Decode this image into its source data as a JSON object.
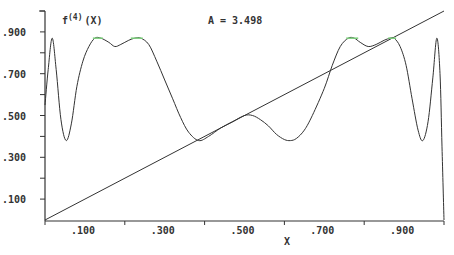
{
  "chart_data": {
    "type": "line",
    "title": "f(4)(X)",
    "title_base": "f",
    "title_sup": "(4)",
    "title_arg": "(X)",
    "annotation": "A = 3.498",
    "xlabel": "X",
    "ylabel": "",
    "xlim": [
      0,
      1
    ],
    "ylim": [
      0,
      1
    ],
    "grid": false,
    "x_tick_labels": [
      ".100",
      ".300",
      ".500",
      ".700",
      ".900"
    ],
    "x_tick_values": [
      0.1,
      0.3,
      0.5,
      0.7,
      0.9
    ],
    "x_minor_ticks": [
      0.0,
      0.2,
      0.4,
      0.6,
      0.8,
      1.0
    ],
    "y_tick_labels": [
      ".100",
      ".300",
      ".500",
      ".700",
      ".900"
    ],
    "y_tick_values": [
      0.1,
      0.3,
      0.5,
      0.7,
      0.9
    ],
    "y_minor_ticks": [
      0.2,
      0.4,
      0.6,
      0.8,
      1.0
    ],
    "colors": {
      "curve": "#333333",
      "axis": "#333333",
      "highlight": "#7ccf7c"
    },
    "series": [
      {
        "name": "f(4)(X)",
        "x": [
          0.0,
          0.008,
          0.018,
          0.028,
          0.04,
          0.053,
          0.066,
          0.08,
          0.095,
          0.11,
          0.125,
          0.14,
          0.16,
          0.175,
          0.19,
          0.21,
          0.225,
          0.24,
          0.26,
          0.28,
          0.3,
          0.32,
          0.34,
          0.36,
          0.385,
          0.41,
          0.44,
          0.47,
          0.5,
          0.52,
          0.54,
          0.56,
          0.58,
          0.6,
          0.615,
          0.63,
          0.65,
          0.67,
          0.7,
          0.72,
          0.74,
          0.76,
          0.775,
          0.79,
          0.81,
          0.83,
          0.85,
          0.865,
          0.875,
          0.89,
          0.905,
          0.92,
          0.935,
          0.947,
          0.96,
          0.972,
          0.982,
          0.99,
          0.995,
          1.0
        ],
        "y": [
          0.55,
          0.72,
          0.87,
          0.72,
          0.48,
          0.38,
          0.46,
          0.64,
          0.76,
          0.83,
          0.87,
          0.87,
          0.85,
          0.83,
          0.84,
          0.86,
          0.87,
          0.87,
          0.84,
          0.76,
          0.67,
          0.58,
          0.49,
          0.42,
          0.38,
          0.4,
          0.44,
          0.47,
          0.5,
          0.5,
          0.48,
          0.45,
          0.41,
          0.385,
          0.38,
          0.39,
          0.43,
          0.5,
          0.63,
          0.74,
          0.83,
          0.87,
          0.87,
          0.85,
          0.83,
          0.84,
          0.86,
          0.87,
          0.87,
          0.83,
          0.74,
          0.58,
          0.43,
          0.38,
          0.47,
          0.68,
          0.87,
          0.7,
          0.35,
          0.0
        ]
      },
      {
        "name": "y = x",
        "x": [
          0.0,
          1.0
        ],
        "y": [
          0.0,
          1.0
        ]
      }
    ],
    "highlight_ranges_x": [
      [
        0.12,
        0.145
      ],
      [
        0.215,
        0.245
      ],
      [
        0.755,
        0.785
      ],
      [
        0.86,
        0.88
      ]
    ]
  }
}
